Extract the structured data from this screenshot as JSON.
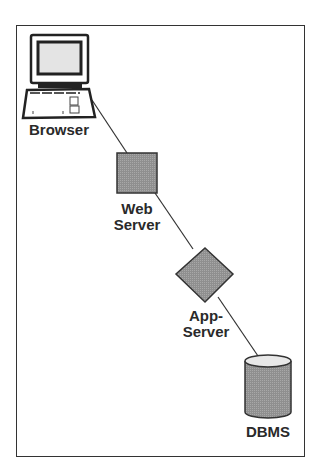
{
  "diagram": {
    "nodes": [
      {
        "id": "browser",
        "label": "Browser",
        "shape": "computer-icon"
      },
      {
        "id": "web-server",
        "label_line1": "Web",
        "label_line2": "Server",
        "shape": "square"
      },
      {
        "id": "app-server",
        "label_line1": "App-",
        "label_line2": "Server",
        "shape": "diamond"
      },
      {
        "id": "dbms",
        "label": "DBMS",
        "shape": "cylinder"
      }
    ],
    "edges": [
      {
        "from": "browser",
        "to": "web-server"
      },
      {
        "from": "web-server",
        "to": "app-server"
      },
      {
        "from": "app-server",
        "to": "dbms"
      }
    ],
    "colors": {
      "node_fill": "#8c8c8c",
      "stroke": "#333333",
      "screen": "#e4e4e4"
    }
  }
}
